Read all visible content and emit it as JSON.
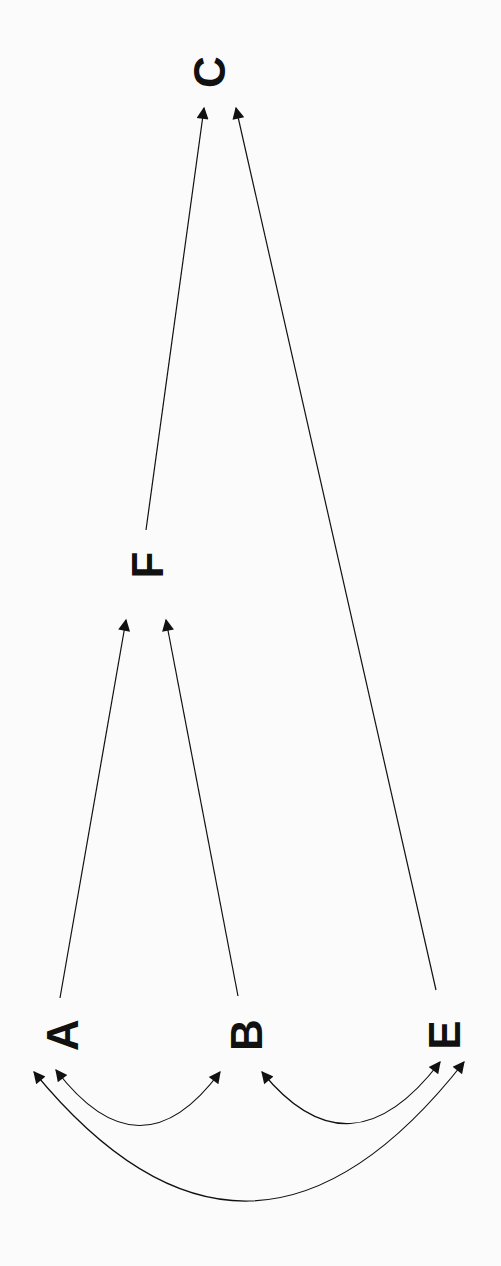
{
  "diagram": {
    "type": "directed-graph",
    "orientation": "rotated-90-ccw",
    "nodes": [
      {
        "id": "C",
        "label": "C",
        "x": 210,
        "y": 52
      },
      {
        "id": "F",
        "label": "F",
        "x": 148,
        "y": 565
      },
      {
        "id": "A",
        "label": "A",
        "x": 60,
        "y": 1035
      },
      {
        "id": "B",
        "label": "B",
        "x": 240,
        "y": 1035
      },
      {
        "id": "E",
        "label": "E",
        "x": 440,
        "y": 1035
      }
    ],
    "edges": [
      {
        "from": "F",
        "to": "C",
        "style": "straight",
        "directed": true
      },
      {
        "from": "E",
        "to": "C",
        "style": "straight",
        "directed": true
      },
      {
        "from": "A",
        "to": "F",
        "style": "straight",
        "directed": true
      },
      {
        "from": "B",
        "to": "F",
        "style": "straight",
        "directed": true
      },
      {
        "from": "A",
        "to": "B",
        "style": "curved",
        "directed": "both"
      },
      {
        "from": "B",
        "to": "E",
        "style": "curved",
        "directed": "both"
      },
      {
        "from": "A",
        "to": "E",
        "style": "curved",
        "directed": "both"
      }
    ],
    "colors": {
      "background": "#fbfbfb",
      "ink": "#111111"
    }
  }
}
